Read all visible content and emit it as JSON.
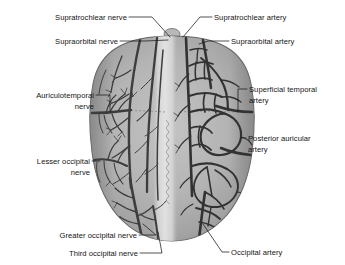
{
  "figure": {
    "background_color": "#ffffff",
    "scalp_color": "#b0b0b0",
    "scalp_edge_color": "#8e8e8e",
    "midline_color": "#dcdcdc",
    "vessel_color": "#3a3a3a",
    "label_color": "#141414",
    "leader_color": "#1a1a1a"
  },
  "labels": {
    "left": [
      {
        "id": "supratrochlear-nerve",
        "lines": [
          "Supratrochlear nerve"
        ],
        "side": "left"
      },
      {
        "id": "supraorbital-nerve",
        "lines": [
          "Supraorbital nerve"
        ],
        "side": "left"
      },
      {
        "id": "auriculotemporal-nerve",
        "lines": [
          "Auriculotemporal",
          "nerve"
        ],
        "side": "left"
      },
      {
        "id": "lesser-occipital-nerve",
        "lines": [
          "Lesser occipital",
          "nerve"
        ],
        "side": "left"
      },
      {
        "id": "greater-occipital-nerve",
        "lines": [
          "Greater occipital nerve"
        ],
        "side": "left"
      },
      {
        "id": "third-occipital-nerve",
        "lines": [
          "Third occipital nerve"
        ],
        "side": "left"
      }
    ],
    "right": [
      {
        "id": "supratrochlear-artery",
        "lines": [
          "Supratrochlear artery"
        ],
        "side": "right"
      },
      {
        "id": "supraorbital-artery",
        "lines": [
          "Supraorbital artery"
        ],
        "side": "right"
      },
      {
        "id": "superficial-temporal-artery",
        "lines": [
          "Superficial temporal",
          "artery"
        ],
        "side": "right"
      },
      {
        "id": "posterior-auricular-artery",
        "lines": [
          "Posterior auricular",
          "artery"
        ],
        "side": "right"
      },
      {
        "id": "occipital-artery",
        "lines": [
          "Occipital artery"
        ],
        "side": "right"
      }
    ],
    "text": {
      "supratrochlear_nerve_l1": "Supratrochlear nerve",
      "supraorbital_nerve_l1": "Supraorbital nerve",
      "auriculotemporal_nerve_l1": "Auriculotemporal",
      "auriculotemporal_nerve_l2": "nerve",
      "lesser_occipital_nerve_l1": "Lesser occipital",
      "lesser_occipital_nerve_l2": "nerve",
      "greater_occipital_nerve_l1": "Greater occipital nerve",
      "third_occipital_nerve_l1": "Third occipital nerve",
      "supratrochlear_artery_l1": "Supratrochlear artery",
      "supraorbital_artery_l1": "Supraorbital artery",
      "superficial_temporal_artery_l1": "Superficial temporal",
      "superficial_temporal_artery_l2": "artery",
      "posterior_auricular_artery_l1": "Posterior auricular",
      "posterior_auricular_artery_l2": "artery",
      "occipital_artery_l1": "Occipital artery"
    }
  }
}
